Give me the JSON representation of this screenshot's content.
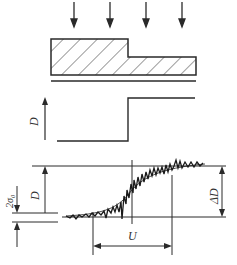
{
  "diagram": {
    "type": "edge-spread measurement schematic",
    "colors": {
      "stroke": "#2a2a2a",
      "hatch": "#3a3a3a",
      "background": "#ffffff"
    },
    "incident_arrows": {
      "count": 4,
      "x": [
        74,
        110,
        146,
        182
      ]
    },
    "object": {
      "description": "stepped hatched block on base plate"
    },
    "ideal_profile": {
      "axis_label": "D"
    },
    "measured_profile": {
      "labels": {
        "density": "D",
        "noise": "2σ₀",
        "delta_density": "ΔD",
        "unsharpness": "U"
      }
    }
  }
}
